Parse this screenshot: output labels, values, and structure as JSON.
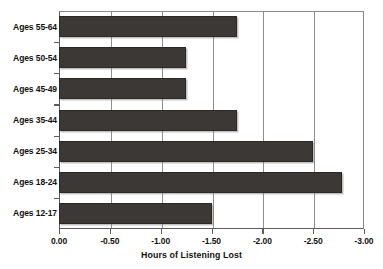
{
  "chart_data": {
    "type": "bar",
    "orientation": "horizontal",
    "title": "",
    "title_fragment_visible": true,
    "xlabel": "Hours of Listening Lost",
    "ylabel": "",
    "categories": [
      "Ages 55-64",
      "Ages 50-54",
      "Ages 45-49",
      "Ages 35-44",
      "Ages 25-34",
      "Ages 18-24",
      "Ages 12-17"
    ],
    "values": [
      -1.75,
      -1.25,
      -1.25,
      -1.75,
      -2.5,
      -2.78,
      -1.5
    ],
    "xlim": [
      0.0,
      -3.0
    ],
    "xticks": [
      0.0,
      -0.5,
      -1.0,
      -1.5,
      -2.0,
      -2.5,
      -3.0
    ],
    "xticklabels": [
      "0.00",
      "-0.50",
      "-1.00",
      "-1.50",
      "-2.00",
      "-2.50",
      "-3.00"
    ],
    "grid": "vertical",
    "legend": "none",
    "bar_color": "#3c3835",
    "axis_color": "#5c5c5c",
    "gridline_color": "#8f8f8f",
    "background": "#ffffff"
  }
}
